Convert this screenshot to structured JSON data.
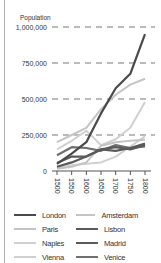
{
  "chart_data": {
    "type": "line",
    "title": "",
    "ylabel": "Population",
    "xlabel": "",
    "x": [
      1500,
      1550,
      1600,
      1650,
      1700,
      1750,
      1800
    ],
    "x_tick_labels": [
      "1500",
      "1550",
      "1600",
      "1650",
      "1700",
      "1750",
      "1800"
    ],
    "y_tick_labels": [
      "1,000,000",
      "750,000",
      "500,000",
      "250,000",
      "0"
    ],
    "y_ticks": [
      1000000,
      750000,
      500000,
      250000,
      0
    ],
    "ylim": [
      0,
      1000000
    ],
    "grid": "horizontal dashed",
    "legend_position": "bottom",
    "series": [
      {
        "name": "London",
        "color": "#4a4a4a",
        "values": [
          50000,
          120000,
          200000,
          400000,
          575000,
          675000,
          950000
        ]
      },
      {
        "name": "Amsterdam",
        "color": "#c4c4c4",
        "values": [
          15000,
          30000,
          60000,
          175000,
          200000,
          210000,
          217000
        ]
      },
      {
        "name": "Paris",
        "color": "#c4c4c4",
        "values": [
          200000,
          250000,
          300000,
          430000,
          530000,
          600000,
          640000
        ]
      },
      {
        "name": "Lisbon",
        "color": "#5a5a5a",
        "values": [
          55000,
          100000,
          100000,
          150000,
          165000,
          150000,
          180000
        ]
      },
      {
        "name": "Naples",
        "color": "#d0d0d0",
        "values": [
          150000,
          210000,
          280000,
          180000,
          220000,
          300000,
          480000
        ]
      },
      {
        "name": "Madrid",
        "color": "#5a5a5a",
        "values": [
          30000,
          60000,
          100000,
          150000,
          140000,
          160000,
          190000
        ]
      },
      {
        "name": "Vienna",
        "color": "#d0d0d0",
        "values": [
          20000,
          40000,
          50000,
          60000,
          100000,
          170000,
          240000
        ]
      },
      {
        "name": "Venice",
        "color": "#707070",
        "values": [
          110000,
          165000,
          160000,
          140000,
          180000,
          160000,
          170000
        ]
      }
    ]
  },
  "legend": {
    "items": [
      {
        "label": "London",
        "color": "#4a4a4a"
      },
      {
        "label": "Amsterdam",
        "color": "#c4c4c4"
      },
      {
        "label": "Paris",
        "color": "#c4c4c4"
      },
      {
        "label": "Lisbon",
        "color": "#5a5a5a"
      },
      {
        "label": "Naples",
        "color": "#d0d0d0"
      },
      {
        "label": "Madrid",
        "color": "#5a5a5a"
      },
      {
        "label": "Vienna",
        "color": "#d0d0d0"
      },
      {
        "label": "Venice",
        "color": "#707070"
      }
    ]
  }
}
